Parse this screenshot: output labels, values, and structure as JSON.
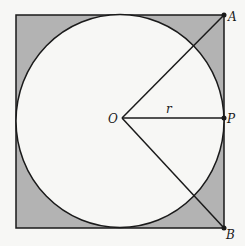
{
  "diagram": {
    "labels": {
      "A": "A",
      "B": "B",
      "O": "O",
      "P": "P",
      "r": "r"
    },
    "colors": {
      "shaded": "#b3b3b3",
      "circle_fill": "#f7f7f5",
      "stroke": "#1a1a1a",
      "background": "#f7f7f5"
    },
    "points": {
      "O": [
        122,
        118
      ],
      "A": [
        224,
        15
      ],
      "B": [
        224,
        228
      ],
      "P": [
        224,
        118
      ]
    },
    "square": {
      "x": 16,
      "y": 15,
      "width": 208,
      "height": 213
    },
    "circle": {
      "cx": 120,
      "cy": 121,
      "rx": 104,
      "ry": 106
    }
  }
}
